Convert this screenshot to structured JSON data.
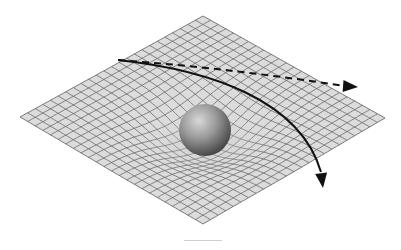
{
  "diagram": {
    "grid": {
      "corners": {
        "top": [
          203,
          16
        ],
        "right": [
          385,
          118
        ],
        "bottom": [
          203,
          224
        ],
        "left": [
          20,
          117
        ]
      },
      "cells": 24,
      "fill": "#dcdcdc",
      "line_color": "#6a6a6a",
      "well_center": [
        206,
        128
      ],
      "well_depth": 22,
      "well_radius": 70
    },
    "mass": {
      "label": "sphere",
      "center": [
        205,
        130
      ],
      "radius": 26,
      "highlight": "#d8d8d8",
      "shade": "#3a3a3a"
    },
    "paths": [
      {
        "name": "straight-path",
        "style": "dashed",
        "d": "M 118 60 C 200 66, 280 76, 344 86",
        "arrow_tip": [
          358,
          87
        ],
        "color": "#111111"
      },
      {
        "name": "curved-path",
        "style": "solid",
        "d": "M 118 60 C 210 70, 300 100, 321 172",
        "arrow_tip": [
          323,
          188
        ],
        "color": "#111111"
      }
    ],
    "caption_line_color": "#cfcfcf"
  }
}
